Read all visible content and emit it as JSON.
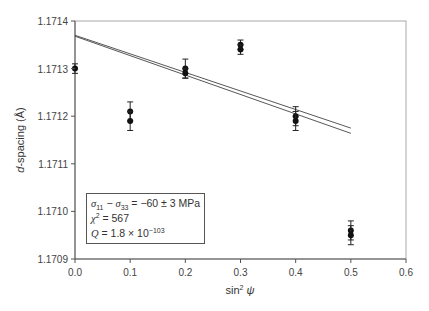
{
  "chart_data": {
    "type": "scatter",
    "title": "",
    "xlabel": "sin² ψ",
    "ylabel": "d-spacing (Å)",
    "xlim": [
      0.0,
      0.6
    ],
    "ylim": [
      1.1709,
      1.1714
    ],
    "x_ticks": [
      "0.0",
      "0.1",
      "0.2",
      "0.3",
      "0.4",
      "0.5",
      "0.6"
    ],
    "y_ticks": [
      "1.1709",
      "1.1710",
      "1.1711",
      "1.1712",
      "1.1713",
      "1.1714"
    ],
    "grid": false,
    "legend_position": "lower-left (inside plot)",
    "series": [
      {
        "name": "measured d-spacing",
        "marker": "filled-circle",
        "points": [
          {
            "x": 0.0,
            "y": 1.1713,
            "err": 1e-05
          },
          {
            "x": 0.1,
            "y": 1.17121,
            "err": 2e-05
          },
          {
            "x": 0.1,
            "y": 1.17119,
            "err": 2e-05
          },
          {
            "x": 0.2,
            "y": 1.1713,
            "err": 2e-05
          },
          {
            "x": 0.2,
            "y": 1.17129,
            "err": 1e-05
          },
          {
            "x": 0.3,
            "y": 1.17135,
            "err": 1e-05
          },
          {
            "x": 0.3,
            "y": 1.17134,
            "err": 1e-05
          },
          {
            "x": 0.4,
            "y": 1.1712,
            "err": 2e-05
          },
          {
            "x": 0.4,
            "y": 1.17119,
            "err": 2e-05
          },
          {
            "x": 0.5,
            "y": 1.17096,
            "err": 2e-05
          },
          {
            "x": 0.5,
            "y": 1.17095,
            "err": 2e-05
          }
        ]
      },
      {
        "name": "linear fit (upper)",
        "type": "line",
        "points": [
          {
            "x": 0.0,
            "y": 1.17137
          },
          {
            "x": 0.5,
            "y": 1.171175
          }
        ]
      },
      {
        "name": "linear fit (lower)",
        "type": "line",
        "points": [
          {
            "x": 0.0,
            "y": 1.171368
          },
          {
            "x": 0.5,
            "y": 1.171164
          }
        ]
      }
    ],
    "annotations": [
      "σ11 − σ33 = −60 ± 3 MPa",
      "χ2 = 567",
      "Q = 1.8 × 10−103"
    ]
  },
  "legend": {
    "stress_lhs_a": "σ",
    "stress_sub_a": "11",
    "stress_minus": " − ",
    "stress_lhs_b": "σ",
    "stress_sub_b": "33",
    "stress_rhs": " = −60 ± 3 MPa",
    "chi_sym": "χ",
    "chi_sup": "2",
    "chi_rhs": " = 567",
    "q_sym": "Q",
    "q_rhs": " = 1.8 × 10",
    "q_exp": "−103"
  }
}
